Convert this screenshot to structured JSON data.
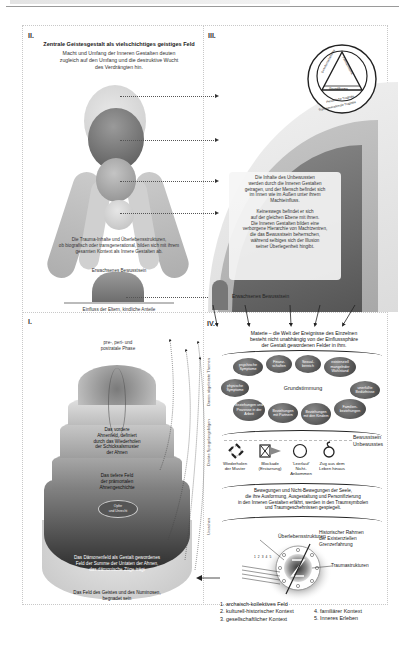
{
  "panels": {
    "ii": {
      "label": "II.",
      "title": "Zentrale Geistesgestalt als vielschichtiges geistiges Feld",
      "subtitle_lines": [
        "Macht und Umfang der Inneren Gestalten deuten",
        "zugleich auf den Umfang und die destruktive Wucht",
        "des Verdrängten hin."
      ],
      "body_lines": [
        "Die Trauma-Inhalte und Überlebensstrukturen,",
        "ob biografisch oder transgenerational, bilden sich mit ihrem",
        "gesamten Kontext als Innere Gestalten ab."
      ],
      "adult_consciousness": "Erwachsenes Bewusstsein",
      "footer": "Einfluss der Eltern, kindliche Anteile"
    },
    "iii": {
      "label": "III.",
      "triangle": {
        "left_side": "Gesellschaftsthema",
        "right_side": "Familienthema",
        "base": "Grundthema",
        "inner_ring": "Persönliche Tragödie",
        "outer_ring": "Transgenerationale Tragödie"
      },
      "box_para1": [
        "Die Inhalte des Unbewussten",
        "werden durch die Inneren Gestalten",
        "getragen, und der Mensch befindet sich",
        "im Innen wie im Außen unter ihrem",
        "Machteinfluss."
      ],
      "box_para2": [
        "Keineswegs befindet er sich",
        "auf der gleichen Ebene mit ihnen.",
        "Die Inneren Gestalten bilden eine",
        "verborgene Hierarchie von Machtzentren,",
        "die das Bewusstsein beherrschen,",
        "während selbiges sich der Illusion",
        "seiner Überlegenheit hingibt."
      ],
      "adult_consciousness": "Erwachsenes Bewusstsein"
    },
    "i": {
      "label": "I.",
      "phase": [
        "pre-, peri- und",
        "postratale Phase"
      ],
      "ancestor_field": [
        "Das vordere",
        "Ahnenfeld, definiert",
        "durch das Wiederholen",
        "der Schicksalsmuster",
        "der Ahnen"
      ],
      "deeper_field": [
        "Das tiefere Feld",
        "der prämortalen",
        "Ahnengeschichte"
      ],
      "center_oval": [
        "Opfer",
        "und Unrecht"
      ],
      "demon_field": [
        "Das Dämonenfeld als Gestalt gewordenes",
        "Feld der Summe der Untaten der Ahnen,",
        "das dämonische Züge trägt"
      ],
      "spirit_field": [
        "Das Feld des Geistes und des Numinosen,",
        "begnadet sein"
      ]
    },
    "iv": {
      "label": "IV.",
      "matter_lines": [
        "Materie – die Welt der Ereignisse des Einzelnen",
        "besteht nicht unabhängig von der Einflusssphäre",
        "der Gestalt gewordenen Felder in ihm."
      ],
      "side_labels": [
        "Davon abgeleitete Themen",
        "Direkte Spiegelungsfolgen",
        "Ursachen"
      ],
      "center_mood": "Grundstimmung",
      "bubbles": [
        "psychische Symptome",
        "Finanz-schaften",
        "Sexual-bereich",
        "existenziell mangelnder Wohlstand",
        "physische Symptome",
        "unerfüllte Bedürfnisse",
        "Beziehungen und Prozesse in der Arbeit",
        "Beziehungen mit Partnern",
        "Beziehungen mit den Kindern",
        "Familien-beziehungen"
      ],
      "consciousness": [
        "Bewusstsein",
        "Unbewusstes"
      ],
      "patterns": [
        {
          "icon": "repeat-arrows-icon",
          "label": [
            "Wiederholen",
            "der Muster"
          ]
        },
        {
          "icon": "blockade-icon",
          "label": [
            "Blockade",
            "(Erstarrung)"
          ]
        },
        {
          "icon": "empty-circle-icon",
          "label": [
            "'Leerlauf'",
            "Nicht-",
            "Ankommen"
          ]
        },
        {
          "icon": "exit-loop-icon",
          "label": [
            "Zug aus dem",
            "Leben hinaus"
          ]
        }
      ],
      "movement_lines": [
        "Bewegungen und Nicht-Bewegungen der Seele,",
        "die ihre Ausformung, Ausgestaltung und Personifizierung",
        "in den Inneren Gestalten erfährt, werden in den Traumsymbolen",
        "und Traumgeschehnissen gespiegelt."
      ],
      "survival": "Überlebensstrukturen",
      "historic": [
        "Historischer Rahmen",
        "der Existenziellen",
        "Grenzerfahrung"
      ],
      "trauma": "Traumastrukturen",
      "ray_numbers": "1 2 3 4 5",
      "legend_left": [
        "1. archaisch-kollektives Feld",
        "2. kulturell-historischer Kontext",
        "3. gesellschaftlicher Kontext"
      ],
      "legend_right": [
        "4. familiärer Kontext",
        "5. Inneres Erleben"
      ]
    }
  },
  "colors": {
    "dark": "#3a3a3a",
    "mid": "#8a8a8a",
    "light": "#d9d9d9",
    "frame": "#c8c8c8"
  }
}
